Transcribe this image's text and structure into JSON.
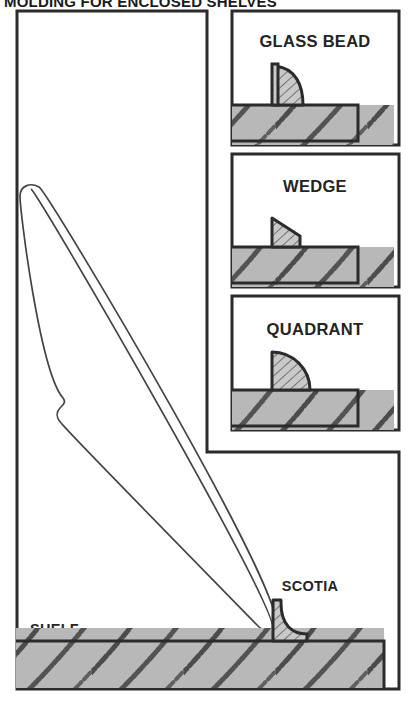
{
  "figure": {
    "title": "MOLDING FOR ENCLOSED SHELVES",
    "background_color": "#ffffff",
    "line_color": "#2b2b2b",
    "wood_fill_color": "#b8b8b8",
    "profile_fill_color": "#c9c9c9",
    "text_color": "#242424"
  },
  "panels": [
    {
      "id": "stock-panel",
      "label": "",
      "profile": "tapered-molding-stock"
    },
    {
      "id": "glass-bead-panel",
      "label": "GLASS BEAD",
      "profile": "bead-quarter-round-with-fillet"
    },
    {
      "id": "wedge-panel",
      "label": "WEDGE",
      "profile": "angled-wedge-triangle"
    },
    {
      "id": "quadrant-panel",
      "label": "QUADRANT",
      "profile": "quarter-circle"
    }
  ],
  "shelf": {
    "label": "SHELF",
    "molding_label": "SCOTIA",
    "molding_profile": "concave-cove"
  }
}
